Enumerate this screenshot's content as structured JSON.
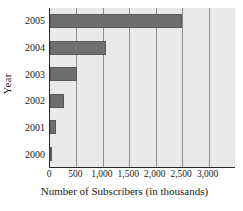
{
  "chart_data": {
    "type": "bar",
    "orientation": "horizontal",
    "title": "",
    "xlabel": "Number of Subscribers (in thousands)",
    "ylabel": "Year",
    "categories": [
      "2005",
      "2004",
      "2003",
      "2002",
      "2001",
      "2000"
    ],
    "values": [
      2500,
      1050,
      520,
      270,
      110,
      15
    ],
    "series": [
      {
        "name": "Number of Subscribers (in thousands)",
        "values": [
          2500,
          1050,
          520,
          270,
          110,
          15
        ]
      }
    ],
    "xlim": [
      0,
      3500
    ],
    "xticks": [
      0,
      500,
      1000,
      1500,
      2000,
      2500,
      3000
    ],
    "xtick_labels": [
      "0",
      "500",
      "1,000",
      "1,500",
      "2,000",
      "2,500",
      "3,000"
    ],
    "ytick_labels": [
      "2005",
      "2004",
      "2003",
      "2002",
      "2001",
      "2000"
    ],
    "grid": "vertical",
    "legend": "none",
    "colors": {
      "bar": "#6e6e6e",
      "bar_edge": "#5a5a5a",
      "plot_background": "#e9e9e9",
      "gridline": "#8e8e8e",
      "axis": "#2b2b2b",
      "text": "#1a1a1a",
      "page_background": "#ffffff"
    }
  }
}
